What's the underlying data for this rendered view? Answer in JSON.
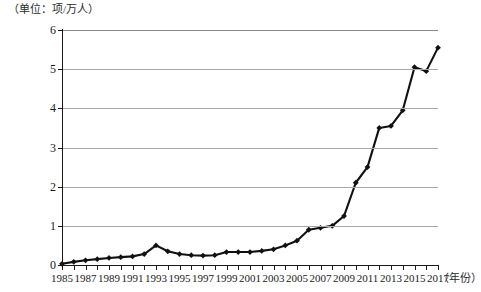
{
  "chart_data": {
    "type": "line",
    "title": "",
    "subtitle": "",
    "unit_label": "（单位：项/万人）",
    "xlabel": "（年份）",
    "ylabel": "",
    "xlim": [
      1985,
      2017
    ],
    "ylim": [
      0,
      6
    ],
    "y_ticks": [
      0,
      1,
      2,
      3,
      4,
      5,
      6
    ],
    "x_ticks": [
      1985,
      1986,
      1987,
      1988,
      1989,
      1990,
      1991,
      1992,
      1993,
      1994,
      1995,
      1996,
      1997,
      1998,
      1999,
      2000,
      2001,
      2002,
      2003,
      2004,
      2005,
      2006,
      2007,
      2008,
      2009,
      2010,
      2011,
      2012,
      2013,
      2014,
      2015,
      2016,
      2017
    ],
    "x_tick_labels": [
      "1985",
      "1987",
      "1989",
      "1991",
      "1993",
      "1995",
      "1997",
      "1999",
      "2001",
      "2003",
      "2005",
      "2007",
      "2009",
      "2011",
      "2013",
      "2015",
      "2017"
    ],
    "x_tick_label_years": [
      1985,
      1987,
      1989,
      1991,
      1993,
      1995,
      1997,
      1999,
      2001,
      2003,
      2005,
      2007,
      2009,
      2011,
      2013,
      2015,
      2017
    ],
    "grid": true,
    "grid_axis": "y",
    "legend": false,
    "legend_position": "none",
    "marker": "diamond",
    "line_color": "#111111",
    "grid_color": "#a8a8a8",
    "x": [
      1985,
      1986,
      1987,
      1988,
      1989,
      1990,
      1991,
      1992,
      1993,
      1994,
      1995,
      1996,
      1997,
      1998,
      1999,
      2000,
      2001,
      2002,
      2003,
      2004,
      2005,
      2006,
      2007,
      2008,
      2009,
      2010,
      2011,
      2012,
      2013,
      2014,
      2015,
      2016,
      2017
    ],
    "values": [
      0.03,
      0.08,
      0.12,
      0.15,
      0.18,
      0.2,
      0.22,
      0.28,
      0.5,
      0.35,
      0.28,
      0.25,
      0.24,
      0.25,
      0.33,
      0.33,
      0.33,
      0.36,
      0.4,
      0.5,
      0.62,
      0.9,
      0.95,
      1.0,
      1.25,
      2.1,
      2.5,
      3.5,
      3.55,
      3.95,
      5.05,
      4.95,
      5.55
    ],
    "series": [
      {
        "name": "每万人发明专利拥有量",
        "values": [
          0.03,
          0.08,
          0.12,
          0.15,
          0.18,
          0.2,
          0.22,
          0.28,
          0.5,
          0.35,
          0.28,
          0.25,
          0.24,
          0.25,
          0.33,
          0.33,
          0.33,
          0.36,
          0.4,
          0.5,
          0.62,
          0.9,
          0.95,
          1.0,
          1.25,
          2.1,
          2.5,
          3.5,
          3.55,
          3.95,
          5.05,
          4.95,
          5.55
        ]
      }
    ]
  }
}
